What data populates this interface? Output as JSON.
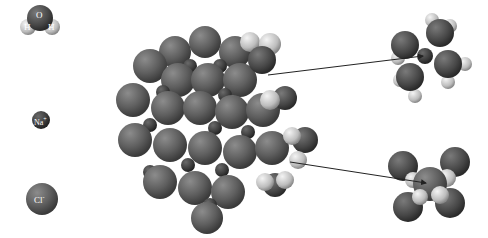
{
  "legend": {
    "water": {
      "o_label": "O",
      "h1_label": "H",
      "h2_label": "H"
    },
    "sodium": {
      "label": "Na",
      "charge": "+"
    },
    "chloride": {
      "label": "Cl",
      "charge": "-"
    }
  },
  "colors": {
    "background": "#ffffff",
    "ion_dark": "#555555",
    "ion_mid": "#6e6e6e",
    "ion_light": "#8a8a8a",
    "hydrogen": "#d8d8d8",
    "arrow": "#222222"
  },
  "annotations": {
    "top_arrow": {
      "from": [
        268,
        75
      ],
      "to": [
        425,
        55
      ],
      "target": "hydrated-sodium-ion"
    },
    "bottom_arrow": {
      "from": [
        290,
        162
      ],
      "to": [
        428,
        183
      ],
      "target": "hydrated-chloride-ion"
    }
  }
}
